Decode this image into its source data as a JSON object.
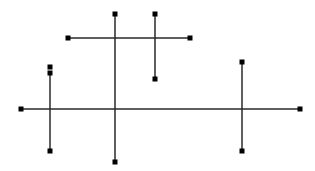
{
  "canvas": {
    "width": 315,
    "height": 171,
    "background": "#ffffff",
    "line_color": "#2a2a2a",
    "handle_color": "#000000",
    "line_width": 1.5,
    "handle_size": 5
  },
  "segments": [
    {
      "id": "top-horizontal",
      "x1": 68,
      "y1": 38,
      "x2": 190,
      "y2": 38
    },
    {
      "id": "center-vertical",
      "x1": 115,
      "y1": 14,
      "x2": 115,
      "y2": 162
    },
    {
      "id": "short-vertical",
      "x1": 155,
      "y1": 14,
      "x2": 155,
      "y2": 79
    },
    {
      "id": "left-vertical",
      "x1": 50,
      "y1": 73,
      "x2": 50,
      "y2": 151
    },
    {
      "id": "main-horizontal",
      "x1": 21,
      "y1": 109,
      "x2": 300,
      "y2": 109
    },
    {
      "id": "right-vertical",
      "x1": 242,
      "y1": 62,
      "x2": 242,
      "y2": 151
    }
  ],
  "handles": [
    {
      "id": "h1",
      "x": 68,
      "y": 38
    },
    {
      "id": "h2",
      "x": 190,
      "y": 38
    },
    {
      "id": "h3",
      "x": 115,
      "y": 14
    },
    {
      "id": "h4",
      "x": 115,
      "y": 162
    },
    {
      "id": "h5",
      "x": 155,
      "y": 14
    },
    {
      "id": "h6",
      "x": 155,
      "y": 79
    },
    {
      "id": "h7",
      "x": 50,
      "y": 67
    },
    {
      "id": "h8",
      "x": 50,
      "y": 73
    },
    {
      "id": "h9",
      "x": 50,
      "y": 151
    },
    {
      "id": "h10",
      "x": 21,
      "y": 109
    },
    {
      "id": "h11",
      "x": 300,
      "y": 109
    },
    {
      "id": "h12",
      "x": 242,
      "y": 62
    },
    {
      "id": "h13",
      "x": 242,
      "y": 151
    }
  ]
}
